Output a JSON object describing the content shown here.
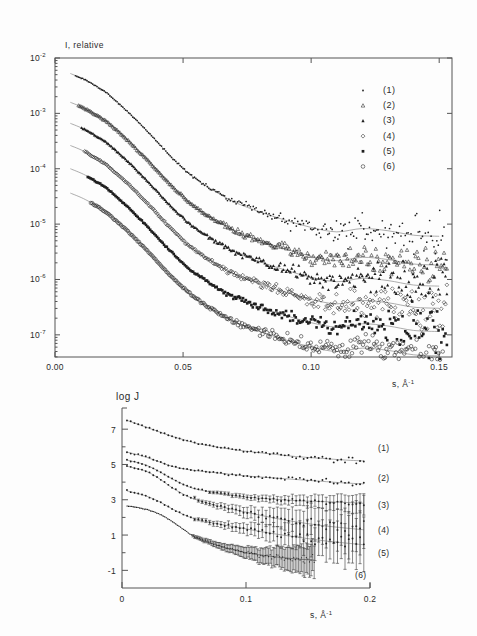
{
  "figure": {
    "background": "#fdfdfd",
    "ink": "#2b2b2b",
    "curve_color": "#8a8a8a",
    "marker_color": "#1f1f1f"
  },
  "panels": [
    {
      "id": "top-panel",
      "name": "intensity-vs-s-panel",
      "ylabel": "I, relative",
      "xlabel_base": "s, Å",
      "xlabel_sup": "-1",
      "frame": {
        "x": 55,
        "y": 58,
        "w": 397,
        "h": 299
      },
      "xticks": [
        "0.00",
        "0.05",
        "0.10",
        "0.15"
      ],
      "xtick_values": [
        0.0,
        0.05,
        0.1,
        0.15
      ],
      "yticks_mantissa": [
        "10",
        "10",
        "10",
        "10",
        "10",
        "10"
      ],
      "yticks_exp": [
        "-2",
        "-3",
        "-4",
        "-5",
        "-6",
        "-7"
      ],
      "ytick_values": [
        -2,
        -3,
        -4,
        -5,
        -6,
        -7
      ],
      "legend": [
        {
          "marker": "dot",
          "label": "(1)"
        },
        {
          "marker": "triangle-open",
          "label": "(2)"
        },
        {
          "marker": "triangle-filled",
          "label": "(3)"
        },
        {
          "marker": "diamond-open",
          "label": "(4)"
        },
        {
          "marker": "square-filled",
          "label": "(5)"
        },
        {
          "marker": "circle-open",
          "label": "(6)"
        }
      ]
    },
    {
      "id": "bottom-panel",
      "name": "logj-vs-s-panel",
      "ylabel": "log J",
      "xlabel_base": "s, Å",
      "xlabel_sup": "-1",
      "frame": {
        "x": 122,
        "y": 408,
        "w": 248,
        "h": 180
      },
      "xticks": [
        "0",
        "0.1",
        "0.2"
      ],
      "xtick_values": [
        0.0,
        0.1,
        0.2
      ],
      "yticks": [
        "7",
        "5",
        "3",
        "1",
        "-1"
      ],
      "ytick_values": [
        7,
        5,
        3,
        1,
        -1
      ],
      "curve_labels": [
        "(1)",
        "(2)",
        "(3)",
        "(4)",
        "(5)",
        "(6)"
      ]
    }
  ],
  "chart_data": [
    {
      "type": "scatter",
      "title": "",
      "xlabel": "s, Å^-1",
      "ylabel": "I, relative",
      "xlim": [
        0.0,
        0.155
      ],
      "ylim_log10": [
        -7.4,
        -2.0
      ],
      "yscale": "log",
      "grid": false,
      "legend_position": "upper-right",
      "series": [
        {
          "name": "(1)",
          "marker": "dot",
          "offset_decades": 0.0,
          "fit_x": [
            0.006,
            0.012,
            0.02,
            0.028,
            0.036,
            0.044,
            0.052,
            0.06,
            0.07,
            0.08,
            0.09,
            0.1,
            0.11,
            0.12,
            0.13,
            0.14,
            0.15
          ],
          "fit_logy": [
            -2.28,
            -2.4,
            -2.62,
            -2.95,
            -3.32,
            -3.72,
            -4.08,
            -4.34,
            -4.6,
            -4.78,
            -4.93,
            -5.06,
            -5.14,
            -5.08,
            -5.12,
            -5.2,
            -5.22
          ]
        },
        {
          "name": "(2)",
          "marker": "triangle-open",
          "offset_decades": -0.52,
          "fit_x": [
            0.006,
            0.012,
            0.02,
            0.028,
            0.036,
            0.044,
            0.052,
            0.06,
            0.07,
            0.08,
            0.09,
            0.1,
            0.11,
            0.12,
            0.13,
            0.14,
            0.15
          ],
          "fit_logy": [
            -2.8,
            -2.92,
            -3.14,
            -3.47,
            -3.84,
            -4.24,
            -4.6,
            -4.86,
            -5.12,
            -5.3,
            -5.45,
            -5.58,
            -5.66,
            -5.6,
            -5.64,
            -5.72,
            -5.74
          ]
        },
        {
          "name": "(3)",
          "marker": "triangle-filled",
          "offset_decades": -0.9,
          "fit_x": [
            0.006,
            0.012,
            0.02,
            0.028,
            0.036,
            0.044,
            0.052,
            0.06,
            0.07,
            0.08,
            0.09,
            0.1,
            0.11,
            0.12,
            0.13,
            0.14,
            0.15
          ],
          "fit_logy": [
            -3.18,
            -3.3,
            -3.52,
            -3.85,
            -4.22,
            -4.62,
            -4.98,
            -5.24,
            -5.5,
            -5.68,
            -5.83,
            -5.96,
            -6.04,
            -5.98,
            -6.02,
            -6.1,
            -6.12
          ]
        },
        {
          "name": "(4)",
          "marker": "diamond-open",
          "offset_decades": -1.3,
          "fit_x": [
            0.006,
            0.012,
            0.02,
            0.028,
            0.036,
            0.044,
            0.052,
            0.06,
            0.07,
            0.08,
            0.09,
            0.1,
            0.11,
            0.12,
            0.13,
            0.14,
            0.15
          ],
          "fit_logy": [
            -3.58,
            -3.7,
            -3.92,
            -4.25,
            -4.62,
            -5.02,
            -5.38,
            -5.64,
            -5.9,
            -6.08,
            -6.23,
            -6.36,
            -6.44,
            -6.38,
            -6.42,
            -6.5,
            -6.52
          ]
        },
        {
          "name": "(5)",
          "marker": "square-filled",
          "offset_decades": -1.72,
          "fit_x": [
            0.006,
            0.012,
            0.02,
            0.028,
            0.036,
            0.044,
            0.052,
            0.06,
            0.07,
            0.08,
            0.09,
            0.1,
            0.11,
            0.12,
            0.13,
            0.14,
            0.15
          ],
          "fit_logy": [
            -4.0,
            -4.12,
            -4.34,
            -4.67,
            -5.04,
            -5.44,
            -5.8,
            -6.06,
            -6.32,
            -6.5,
            -6.65,
            -6.78,
            -6.86,
            -6.8,
            -6.84,
            -6.92,
            -6.94
          ]
        },
        {
          "name": "(6)",
          "marker": "circle-open",
          "offset_decades": -2.16,
          "fit_x": [
            0.006,
            0.012,
            0.02,
            0.028,
            0.036,
            0.044,
            0.052,
            0.06,
            0.07,
            0.08,
            0.09,
            0.1,
            0.11,
            0.12,
            0.13,
            0.14,
            0.15
          ],
          "fit_logy": [
            -4.44,
            -4.56,
            -4.78,
            -5.11,
            -5.48,
            -5.88,
            -6.24,
            -6.5,
            -6.76,
            -6.94,
            -7.09,
            -7.22,
            -7.3,
            -7.24,
            -7.28,
            -7.36,
            -7.38
          ]
        }
      ]
    },
    {
      "type": "scatter",
      "title": "",
      "xlabel": "s, Å^-1",
      "ylabel": "log J",
      "xlim": [
        0.0,
        0.2
      ],
      "ylim": [
        -2.0,
        8.2
      ],
      "grid": false,
      "legend_position": "right-of-curves",
      "series": [
        {
          "name": "(1)",
          "fit_x": [
            0.004,
            0.01,
            0.02,
            0.03,
            0.04,
            0.05,
            0.06,
            0.08,
            0.1,
            0.12,
            0.14,
            0.16,
            0.18,
            0.195
          ],
          "fit_y": [
            7.5,
            7.35,
            7.1,
            6.85,
            6.6,
            6.4,
            6.2,
            5.95,
            5.75,
            5.6,
            5.45,
            5.35,
            5.25,
            5.2
          ],
          "has_errorbars": false
        },
        {
          "name": "(2)",
          "fit_x": [
            0.004,
            0.01,
            0.02,
            0.03,
            0.04,
            0.05,
            0.06,
            0.08,
            0.1,
            0.12,
            0.14,
            0.16,
            0.18,
            0.195
          ],
          "fit_y": [
            5.7,
            5.6,
            5.4,
            5.15,
            4.9,
            4.75,
            4.65,
            4.5,
            4.35,
            4.25,
            4.15,
            4.05,
            3.95,
            3.9
          ],
          "has_errorbars": false
        },
        {
          "name": "(3)",
          "fit_x": [
            0.004,
            0.01,
            0.02,
            0.03,
            0.04,
            0.05,
            0.06,
            0.08,
            0.1,
            0.12,
            0.14,
            0.16,
            0.18,
            0.195
          ],
          "fit_y": [
            5.25,
            5.15,
            4.95,
            4.6,
            4.2,
            3.85,
            3.6,
            3.35,
            3.15,
            3.05,
            2.95,
            2.9,
            2.85,
            2.8
          ],
          "has_errorbars": true
        },
        {
          "name": "(4)",
          "fit_x": [
            0.004,
            0.01,
            0.02,
            0.03,
            0.04,
            0.05,
            0.06,
            0.08,
            0.1,
            0.12,
            0.14,
            0.16,
            0.18,
            0.195
          ],
          "fit_y": [
            4.9,
            4.8,
            4.6,
            4.2,
            3.7,
            3.3,
            3.0,
            2.6,
            2.3,
            2.0,
            1.75,
            1.55,
            1.4,
            1.3
          ],
          "has_errorbars": true
        },
        {
          "name": "(5)",
          "fit_x": [
            0.004,
            0.01,
            0.02,
            0.03,
            0.04,
            0.05,
            0.06,
            0.08,
            0.1,
            0.12,
            0.14,
            0.16,
            0.18,
            0.195
          ],
          "fit_y": [
            3.5,
            3.4,
            3.2,
            2.9,
            2.5,
            2.15,
            1.9,
            1.6,
            1.35,
            1.1,
            0.9,
            0.7,
            0.55,
            0.45
          ],
          "has_errorbars": true
        },
        {
          "name": "(6)",
          "fit_x": [
            0.004,
            0.01,
            0.02,
            0.03,
            0.04,
            0.05,
            0.06,
            0.08,
            0.1,
            0.12,
            0.14,
            0.155
          ],
          "fit_y": [
            2.65,
            2.6,
            2.45,
            2.2,
            1.8,
            1.3,
            0.85,
            0.35,
            0.0,
            -0.2,
            -0.35,
            -0.42
          ],
          "has_errorbars": true
        }
      ]
    }
  ]
}
